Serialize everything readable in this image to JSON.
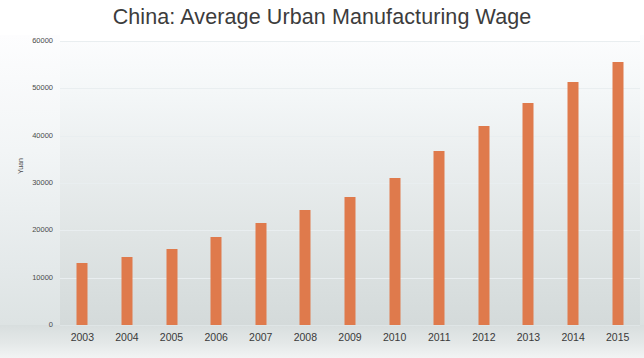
{
  "chart_data": {
    "type": "bar",
    "title": "China: Average Urban Manufacturing Wage",
    "xlabel": "",
    "ylabel": "Yuan",
    "categories": [
      "2003",
      "2004",
      "2005",
      "2006",
      "2007",
      "2008",
      "2009",
      "2010",
      "2011",
      "2012",
      "2013",
      "2014",
      "2015"
    ],
    "values": [
      13000,
      14300,
      16000,
      18500,
      21500,
      24400,
      27000,
      31000,
      36800,
      42000,
      46800,
      51400,
      55500
    ],
    "ylim": [
      0,
      60000
    ],
    "yticks": [
      0,
      10000,
      20000,
      30000,
      40000,
      50000,
      60000
    ],
    "ytick_labels": [
      "0",
      "10000",
      "20000",
      "30000",
      "40000",
      "50000",
      "60000"
    ],
    "grid": true,
    "legend": null,
    "series": [
      {
        "name": "Average Urban Manufacturing Wage",
        "color": "#df7a4c",
        "values": [
          13000,
          14300,
          16000,
          18500,
          21500,
          24400,
          27000,
          31000,
          36800,
          42000,
          46800,
          51400,
          55500
        ]
      }
    ]
  },
  "colors": {
    "bar": "#df7a4c",
    "gridline": "#e9eef0",
    "title_text": "#3c3c3c",
    "tick_text": "#3a3a3a",
    "plot_background": "#eaeeef"
  }
}
